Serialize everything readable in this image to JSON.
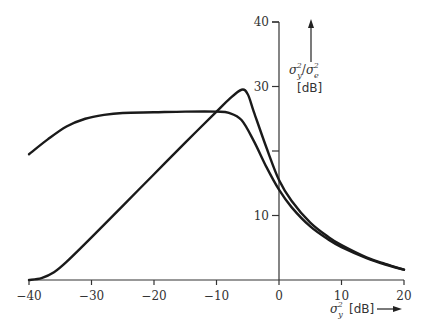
{
  "chart_data": {
    "type": "line",
    "title": "",
    "xlabel": "σ_y^2 [dB]",
    "ylabel": "σ_y^2/σ_e^2 [dB]",
    "xlim": [
      -40,
      20
    ],
    "ylim": [
      0,
      40
    ],
    "x_ticks": [
      -40,
      -30,
      -20,
      -10,
      0,
      10,
      20
    ],
    "x_tick_labels": [
      "−40",
      "−30",
      "−20",
      "−10",
      "0",
      "10",
      "20"
    ],
    "y_ticks": [
      10,
      30,
      40
    ],
    "y_tick_labels": [
      "10",
      "30",
      "40"
    ],
    "y_minor_ticks": [
      20
    ],
    "grid": false,
    "legend": null,
    "series": [
      {
        "name": "plateau curve",
        "x": [
          -40,
          -37,
          -34,
          -31,
          -28,
          -25,
          -20,
          -15,
          -10,
          -8,
          -6,
          -4,
          -2,
          0,
          2,
          5,
          8,
          10,
          14,
          17,
          20
        ],
        "values": [
          19.5,
          21.8,
          23.8,
          25.0,
          25.6,
          25.9,
          26.0,
          26.1,
          26.1,
          25.9,
          24.8,
          21.5,
          17.5,
          14.0,
          11.3,
          8.3,
          6.2,
          5.1,
          3.4,
          2.4,
          1.6
        ]
      },
      {
        "name": "ramp curve",
        "x": [
          -40,
          -38,
          -36,
          -34,
          -30,
          -25,
          -20,
          -15,
          -10,
          -8,
          -6,
          -5,
          -4,
          -2,
          0,
          2,
          5,
          8,
          10,
          14,
          17,
          20
        ],
        "values": [
          0,
          0.3,
          1.2,
          2.8,
          6.6,
          11.5,
          16.4,
          21.3,
          26.1,
          28.0,
          29.5,
          28.8,
          26.0,
          20.5,
          15.5,
          12.3,
          8.9,
          6.6,
          5.4,
          3.5,
          2.5,
          1.6
        ]
      }
    ]
  },
  "labels": {
    "x_axis_symbol": "σ",
    "x_axis_sub": "y",
    "x_axis_sup": "2",
    "x_axis_unit": "[dB]",
    "y_axis_num": "σ",
    "y_axis_num_sub": "y",
    "y_axis_num_sup": "2",
    "y_axis_slash": "/",
    "y_axis_den": "σ",
    "y_axis_den_sub": "e",
    "y_axis_den_sup": "2",
    "y_axis_unit": "[dB]"
  }
}
